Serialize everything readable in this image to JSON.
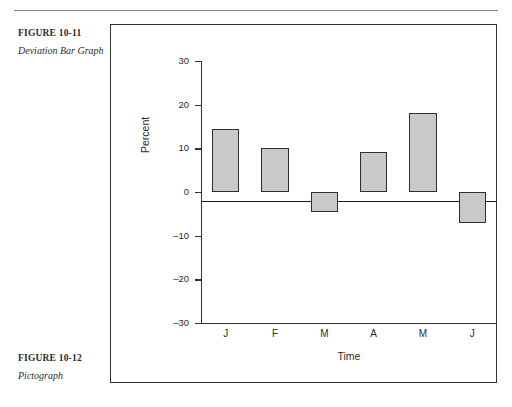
{
  "captions": [
    {
      "figure": "FIGURE 10-11",
      "title": "Deviation Bar Graph"
    },
    {
      "figure": "FIGURE 10-12",
      "title": "Pictograph"
    }
  ],
  "chart_data": {
    "type": "bar",
    "title": "",
    "categories": [
      "J",
      "F",
      "M",
      "A",
      "M",
      "J"
    ],
    "values": [
      14.5,
      10,
      -4.5,
      9.2,
      18.2,
      -7
    ],
    "xlabel": "Time",
    "ylabel": "Percent",
    "ylim": [
      -30,
      30
    ],
    "yticks": [
      30,
      20,
      10,
      0,
      -10,
      -20,
      -30
    ],
    "ytick_labels": [
      "30",
      "20",
      "10",
      "0",
      "-10",
      "-20",
      "-30"
    ],
    "grid": false,
    "legend": null,
    "bar_fill_color": "#c9c9c9",
    "bar_edge_color": "#2e2e2e",
    "axis_color": "#333333",
    "zero_reference": 0
  }
}
